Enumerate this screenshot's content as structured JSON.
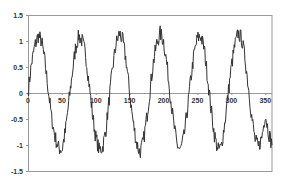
{
  "chart_data": {
    "type": "line",
    "title": "",
    "xlabel": "",
    "ylabel": "",
    "xlim": [
      0,
      360
    ],
    "ylim": [
      -1.5,
      1.5
    ],
    "x_ticks": [
      "0",
      "50",
      "100",
      "150",
      "200",
      "250",
      "300",
      "350"
    ],
    "y_ticks": [
      "1.5",
      "1",
      "0.5",
      "0",
      "-0.5",
      "-1",
      "-1.5"
    ],
    "grid": false,
    "legend": null,
    "series": [
      {
        "name": "noisy sine",
        "description": "Noisy sine wave, amplitude ~1 (peaks ~1.2, troughs ~-1.2), period ~63 units, starting at 0 at x=0",
        "x": [
          0,
          5,
          10,
          15,
          20,
          25,
          30,
          35,
          40,
          45,
          50,
          55,
          60,
          65,
          70,
          75,
          80,
          85,
          90,
          95,
          100,
          105,
          110,
          115,
          120,
          125,
          130,
          135,
          140,
          145,
          150,
          155,
          160,
          165,
          170,
          175,
          180,
          185,
          190,
          195,
          200,
          205,
          210,
          215,
          220,
          225,
          230,
          235,
          240,
          245,
          250,
          255,
          260,
          265,
          270,
          275,
          280,
          285,
          290,
          295,
          300,
          305,
          310,
          315,
          320,
          325,
          330,
          335,
          340,
          345,
          350,
          355,
          360
        ],
        "values": [
          0.0,
          0.55,
          0.9,
          1.1,
          1.0,
          0.6,
          0.05,
          -0.5,
          -0.85,
          -1.05,
          -1.1,
          -0.75,
          -0.2,
          0.35,
          0.85,
          1.1,
          1.0,
          0.75,
          0.2,
          -0.4,
          -0.85,
          -1.1,
          -1.05,
          -0.7,
          -0.1,
          0.5,
          0.95,
          1.15,
          1.0,
          0.6,
          0.0,
          -0.55,
          -0.95,
          -1.15,
          -0.95,
          -0.5,
          0.05,
          0.6,
          0.95,
          1.15,
          1.0,
          0.55,
          -0.05,
          -0.6,
          -1.0,
          -1.1,
          -0.85,
          -0.35,
          0.25,
          0.75,
          1.05,
          1.1,
          0.85,
          0.3,
          -0.3,
          -0.8,
          -1.1,
          -1.05,
          -0.6,
          -0.05,
          0.5,
          0.9,
          1.15,
          1.05,
          0.7,
          0.15,
          -0.45,
          -0.9,
          -1.05,
          -0.85,
          -0.4,
          -0.75,
          -1.0
        ]
      }
    ],
    "colors": {
      "line": "#333333",
      "frame": "#999999",
      "zero_line": "#999999"
    }
  }
}
